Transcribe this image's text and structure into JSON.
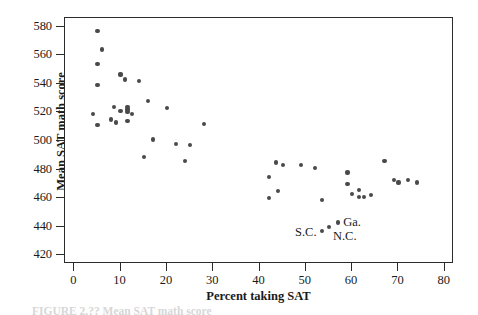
{
  "figure": {
    "caption_partial": "FIGURE 2.?? Mean SAT math score",
    "point_color": "#4a4a4a",
    "axis_color": "#2b2b2b"
  },
  "chart_data": {
    "type": "scatter",
    "title": "",
    "xlabel": "Percent taking SAT",
    "ylabel": "Mean SAT math score",
    "xlim": [
      -2,
      82
    ],
    "ylim": [
      414,
      586
    ],
    "xticks": [
      0,
      10,
      20,
      30,
      40,
      50,
      60,
      70,
      80
    ],
    "yticks": [
      420,
      440,
      460,
      480,
      500,
      520,
      540,
      560,
      580
    ],
    "grid": false,
    "legend": "none",
    "series": [
      {
        "name": "States",
        "points": [
          {
            "x": 4.0,
            "y": 519
          },
          {
            "x": 5.0,
            "y": 577
          },
          {
            "x": 5.0,
            "y": 554
          },
          {
            "x": 5.0,
            "y": 539
          },
          {
            "x": 5.0,
            "y": 511
          },
          {
            "x": 6.0,
            "y": 564
          },
          {
            "x": 8.0,
            "y": 515
          },
          {
            "x": 8.5,
            "y": 524
          },
          {
            "x": 9.0,
            "y": 513
          },
          {
            "x": 10.0,
            "y": 547
          },
          {
            "x": 10.0,
            "y": 546
          },
          {
            "x": 10.0,
            "y": 521
          },
          {
            "x": 11.0,
            "y": 543
          },
          {
            "x": 11.5,
            "y": 524
          },
          {
            "x": 11.5,
            "y": 522
          },
          {
            "x": 11.5,
            "y": 520
          },
          {
            "x": 11.5,
            "y": 514
          },
          {
            "x": 12.5,
            "y": 519
          },
          {
            "x": 14.0,
            "y": 542
          },
          {
            "x": 15.0,
            "y": 489
          },
          {
            "x": 16.0,
            "y": 528
          },
          {
            "x": 17.0,
            "y": 501
          },
          {
            "x": 20.0,
            "y": 523
          },
          {
            "x": 22.0,
            "y": 498
          },
          {
            "x": 24.0,
            "y": 486
          },
          {
            "x": 25.0,
            "y": 497
          },
          {
            "x": 28.0,
            "y": 512
          },
          {
            "x": 42.0,
            "y": 475
          },
          {
            "x": 42.0,
            "y": 460
          },
          {
            "x": 43.5,
            "y": 485
          },
          {
            "x": 44.0,
            "y": 465
          },
          {
            "x": 45.0,
            "y": 483
          },
          {
            "x": 49.0,
            "y": 483
          },
          {
            "x": 52.0,
            "y": 481
          },
          {
            "x": 53.5,
            "y": 459
          },
          {
            "x": 53.5,
            "y": 437
          },
          {
            "x": 55.0,
            "y": 440
          },
          {
            "x": 57.0,
            "y": 443
          },
          {
            "x": 59.0,
            "y": 478
          },
          {
            "x": 59.0,
            "y": 470
          },
          {
            "x": 60.0,
            "y": 463
          },
          {
            "x": 61.5,
            "y": 466
          },
          {
            "x": 61.5,
            "y": 461
          },
          {
            "x": 62.5,
            "y": 461
          },
          {
            "x": 64.0,
            "y": 462
          },
          {
            "x": 67.0,
            "y": 486
          },
          {
            "x": 69.0,
            "y": 473
          },
          {
            "x": 70.0,
            "y": 471
          },
          {
            "x": 72.0,
            "y": 473
          },
          {
            "x": 74.0,
            "y": 471
          }
        ]
      }
    ],
    "annotations": [
      {
        "text": "S.C.",
        "x": 53.5,
        "y": 437,
        "placement": "left"
      },
      {
        "text": "N.C.",
        "x": 55.0,
        "y": 440,
        "placement": "below-right"
      },
      {
        "text": "Ga.",
        "x": 57.0,
        "y": 443,
        "placement": "right"
      }
    ]
  }
}
